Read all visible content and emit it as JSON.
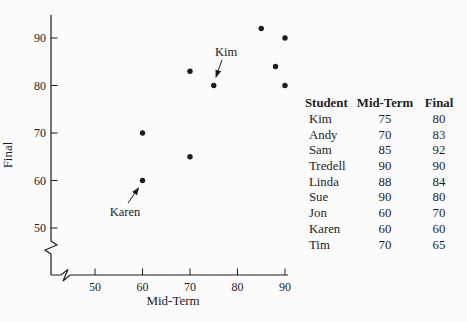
{
  "colors": {
    "ink": "#1c1c1c",
    "background": "#fcfcfc"
  },
  "chart_data": {
    "type": "scatter",
    "title": "",
    "xlabel": "Mid-Term",
    "ylabel": "Final",
    "x_ticks": [
      50,
      60,
      70,
      80,
      90
    ],
    "y_ticks": [
      50,
      60,
      70,
      80,
      90
    ],
    "xlim": [
      45,
      92
    ],
    "ylim": [
      45,
      95
    ],
    "axis_break": true,
    "grid": false,
    "points": [
      {
        "student": "Kim",
        "x": 75,
        "y": 80
      },
      {
        "student": "Andy",
        "x": 70,
        "y": 83
      },
      {
        "student": "Sam",
        "x": 85,
        "y": 92
      },
      {
        "student": "Tredell",
        "x": 90,
        "y": 90
      },
      {
        "student": "Linda",
        "x": 88,
        "y": 84
      },
      {
        "student": "Sue",
        "x": 90,
        "y": 80
      },
      {
        "student": "Jon",
        "x": 60,
        "y": 70
      },
      {
        "student": "Karen",
        "x": 60,
        "y": 60
      },
      {
        "student": "Tim",
        "x": 70,
        "y": 65
      }
    ],
    "annotations": [
      {
        "label": "Kim",
        "x": 75,
        "y": 80
      },
      {
        "label": "Karen",
        "x": 60,
        "y": 60
      }
    ]
  },
  "table": {
    "headers": [
      "Student",
      "Mid-Term",
      "Final"
    ],
    "rows": [
      {
        "student": "Kim",
        "midterm": "75",
        "final": "80"
      },
      {
        "student": "Andy",
        "midterm": "70",
        "final": "83"
      },
      {
        "student": "Sam",
        "midterm": "85",
        "final": "92"
      },
      {
        "student": "Tredell",
        "midterm": "90",
        "final": "90"
      },
      {
        "student": "Linda",
        "midterm": "88",
        "final": "84"
      },
      {
        "student": "Sue",
        "midterm": "90",
        "final": "80"
      },
      {
        "student": "Jon",
        "midterm": "60",
        "final": "70"
      },
      {
        "student": "Karen",
        "midterm": "60",
        "final": "60"
      },
      {
        "student": "Tim",
        "midterm": "70",
        "final": "65"
      }
    ]
  }
}
